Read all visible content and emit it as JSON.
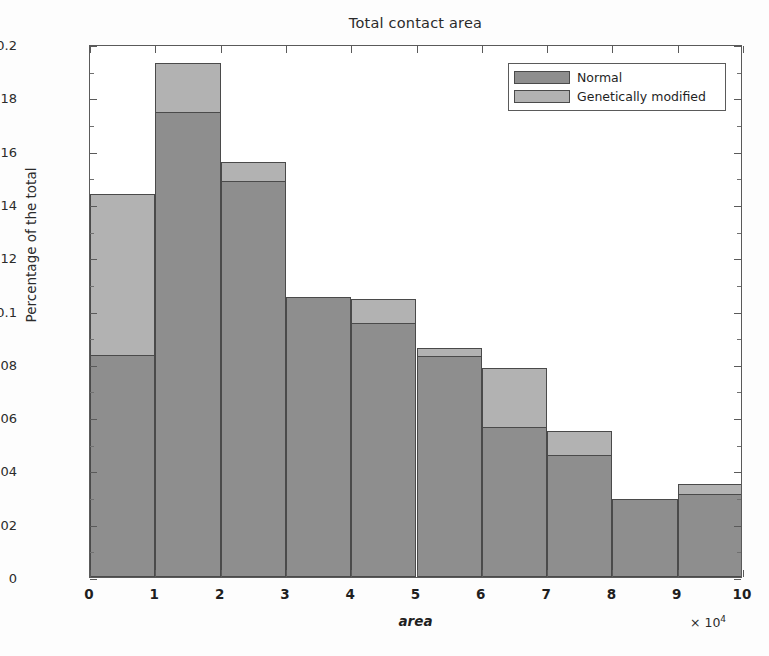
{
  "chart_data": {
    "type": "bar",
    "title": "Total contact area",
    "xlabel": "area",
    "ylabel": "Percentage of the total",
    "x_multiplier": "× 10",
    "x_multiplier_exp": "4",
    "xlim": [
      0,
      10
    ],
    "ylim": [
      0,
      0.2
    ],
    "xticks": [
      "0",
      "1",
      "2",
      "3",
      "4",
      "5",
      "6",
      "7",
      "8",
      "9",
      "10"
    ],
    "ytick_labels": [
      "0",
      "0.02",
      "0.04",
      "0.06",
      "0.08",
      "0.1",
      "0.12",
      "0.14",
      "0.16",
      "0.18",
      "0.2"
    ],
    "ytick_values": [
      0,
      0.02,
      0.04,
      0.06,
      0.08,
      0.1,
      0.12,
      0.14,
      0.16,
      0.18,
      0.2
    ],
    "grid": false,
    "bar_style": "overlaid-histogram",
    "bin_edges": [
      0,
      1,
      2,
      3,
      4,
      5,
      6,
      7,
      8,
      9,
      10
    ],
    "bin_centers": [
      0.5,
      1.5,
      2.5,
      3.5,
      4.5,
      5.5,
      6.5,
      7.5,
      8.5,
      9.5
    ],
    "series": [
      {
        "name": "Normal",
        "color": "#8e8e8e",
        "values": [
          0.0833,
          0.1745,
          0.1486,
          0.105,
          0.0953,
          0.0829,
          0.0563,
          0.0458,
          0.0293,
          0.0311
        ]
      },
      {
        "name": "Genetically modified",
        "color": "#b2b2b2",
        "values": [
          0.1437,
          0.1929,
          0.1557,
          0.105,
          0.1043,
          0.0859,
          0.0785,
          0.0548,
          0.0293,
          0.0349
        ]
      }
    ],
    "legend": {
      "position": "top-right",
      "entries": [
        {
          "label": "Normal",
          "color": "#8e8e8e"
        },
        {
          "label": "Genetically modified",
          "color": "#b2b2b2"
        }
      ]
    },
    "colors": {
      "normal": "#8e8e8e",
      "genetically_modified": "#b2b2b2",
      "axis": "#5a5a5a",
      "bar_edge": "#4a4a4a",
      "background": "#ffffff"
    }
  }
}
